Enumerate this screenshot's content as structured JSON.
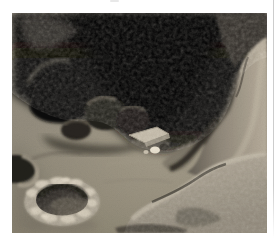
{
  "page": {
    "kind": "scanned page fragment with a single photograph"
  },
  "photo": {
    "title": "Cave interior with excavated pit",
    "description": "Photograph of a cave interior: a dark domed ceiling with a large black opening at the upper right, rock alcoves and boulders along the left wall, a light rocky outcrop on the right, a sloping earthen floor with a flat stone slab and small light and dark stones near the center, a circular excavated pit with a raised pale crusty rim in the lower-left foreground, a second partial pit at the left edge, and a rough rocky ledge across the lower right.",
    "scene_elements": [
      "dark cave ceiling",
      "large black opening upper right",
      "left wall alcove and boulders",
      "right rock outcrop",
      "earthen cave floor",
      "flat stone slab with small stones",
      "excavated pit with raised rim",
      "partial pit at left edge",
      "foreground rocky ledge"
    ]
  },
  "palette": {
    "page_background": "#ffffff",
    "edge_line": "#cdcdcd",
    "top_mark": "#dcdcdc",
    "ceiling_dark": "#060606",
    "floor_mid": "#8d887b",
    "floor_light": "#a09a89",
    "outcrop_light": "#b0a89a",
    "ledge_crust": "#beb8aa",
    "pit_rim": "#c6c0b2",
    "pit_interior": "#2a2723",
    "slab": "#b7b1a3",
    "white_stone": "#dcd7ca",
    "dark_stone": "#2f2c27"
  }
}
